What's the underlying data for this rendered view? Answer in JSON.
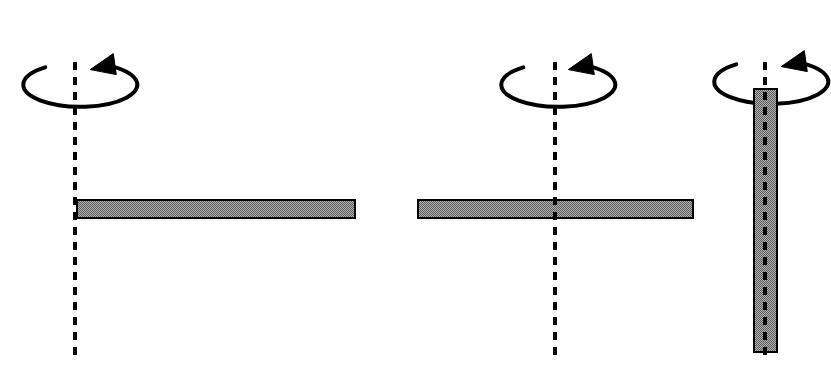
{
  "figure": {
    "domain": "Diagram",
    "canvas": {
      "width": 831,
      "height": 378,
      "background": "#ffffff"
    },
    "style": {
      "rod_fill_color": "#8c8c8c",
      "rod_border_color": "#000000",
      "rod_border_width": 2,
      "rod_hatch": "checker-dither",
      "axis_line_color": "#000000",
      "axis_dash_pattern": "8 7",
      "axis_line_width": 4,
      "arrow_color": "#000000",
      "arrow_stroke_width": 4
    },
    "panels": [
      {
        "id": "panel-1",
        "name": "rod-rotating-about-end-axis",
        "axis": {
          "name": "vertical-dashed-rotation-axis",
          "orientation": "vertical",
          "x": 75,
          "y_top": 62,
          "y_bottom": 360
        },
        "rod": {
          "name": "horizontal-rod",
          "orientation": "horizontal",
          "x": 76,
          "y": 199,
          "length": 280,
          "thickness": 20,
          "pivot_position": "left-end"
        },
        "rotation_arrow": {
          "name": "counterclockwise-rotation-arrow",
          "center_x": 72,
          "center_y": 48,
          "rx": 57,
          "ry": 22,
          "direction": "clockwise-viewed-from-above",
          "arrowhead_at": "right"
        }
      },
      {
        "id": "panel-2",
        "name": "rod-rotating-about-center-axis",
        "axis": {
          "name": "vertical-dashed-rotation-axis",
          "orientation": "vertical",
          "x": 555,
          "y_top": 62,
          "y_bottom": 360
        },
        "rod": {
          "name": "horizontal-rod",
          "orientation": "horizontal",
          "x": 417,
          "y": 199,
          "length": 277,
          "thickness": 20,
          "pivot_position": "center"
        },
        "rotation_arrow": {
          "name": "counterclockwise-rotation-arrow",
          "center_x": 550,
          "center_y": 48,
          "rx": 57,
          "ry": 22,
          "direction": "clockwise-viewed-from-above",
          "arrowhead_at": "right"
        }
      },
      {
        "id": "panel-3",
        "name": "rod-rotating-about-its-own-long-axis",
        "axis": {
          "name": "vertical-dashed-rotation-axis",
          "orientation": "vertical",
          "x": 765,
          "y_top": 62,
          "y_bottom": 360
        },
        "rod": {
          "name": "vertical-rod",
          "orientation": "vertical",
          "x": 753,
          "y": 88,
          "length": 265,
          "thickness": 25,
          "pivot_position": "along-length"
        },
        "rotation_arrow": {
          "name": "counterclockwise-rotation-arrow",
          "center_x": 763,
          "center_y": 45,
          "rx": 57,
          "ry": 22,
          "direction": "clockwise-viewed-from-above",
          "arrowhead_at": "right"
        }
      }
    ]
  }
}
